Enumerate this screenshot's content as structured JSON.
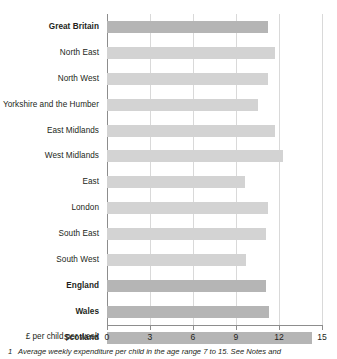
{
  "chart_data": {
    "type": "bar",
    "orientation": "horizontal",
    "title": "",
    "xlabel": "£ per child per week",
    "ylabel": "",
    "xlim": [
      0,
      15
    ],
    "xticks": [
      0,
      3,
      6,
      9,
      12,
      15
    ],
    "xtick_labels": [
      "0",
      "3",
      "6",
      "9",
      "12",
      "15"
    ],
    "grid": true,
    "legend": "none",
    "categories": [
      "Great Britain",
      "North East",
      "North West",
      "Yorkshire and the Humber",
      "East Midlands",
      "West Midlands",
      "East",
      "London",
      "South East",
      "South West",
      "England",
      "Wales",
      "Scotland"
    ],
    "values": [
      11.2,
      11.7,
      11.2,
      10.5,
      11.7,
      12.3,
      9.6,
      11.2,
      11.1,
      9.7,
      11.1,
      11.3,
      14.3
    ],
    "emphasis": [
      true,
      false,
      false,
      false,
      false,
      false,
      false,
      false,
      false,
      false,
      true,
      true,
      true
    ],
    "colors": {
      "bar_normal": "#d3d3d3",
      "bar_emphasis": "#b5b5b5",
      "gridline": "#d9d9d9",
      "axis": "#8d8d8d",
      "text": "#231f20"
    }
  },
  "footnote": {
    "marker": "1",
    "text": "Average weekly expenditure per child in the age range 7 to 15. See Notes and"
  }
}
